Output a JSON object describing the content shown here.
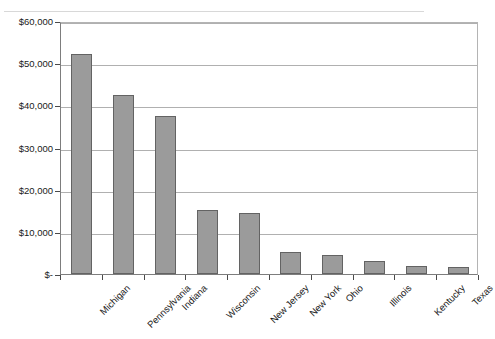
{
  "chart_data": {
    "type": "bar",
    "title": "",
    "subtitle": "",
    "xlabel": "",
    "ylabel": "",
    "categories": [
      "Michigan",
      "Pennsylvania",
      "Indiana",
      "Wisconsin",
      "New Jersey",
      "New York",
      "Ohio",
      "Illinois",
      "Kentucky",
      "Texas"
    ],
    "values": [
      52200,
      42500,
      37500,
      15100,
      14400,
      5200,
      4600,
      3100,
      1800,
      1600
    ],
    "ylim": [
      0,
      60000
    ],
    "ytick_values": [
      0,
      10000,
      20000,
      30000,
      40000,
      50000,
      60000
    ],
    "ytick_labels": [
      "$-",
      "$10,000",
      "$20,000",
      "$30,000",
      "$40,000",
      "$50,000",
      "$60,000"
    ],
    "grid": true,
    "grid_axis": "y",
    "legend": false,
    "legend_position": "none",
    "series": [
      {
        "name": "",
        "values": [
          52200,
          42500,
          37500,
          15100,
          14400,
          5200,
          4600,
          3100,
          1800,
          1600
        ]
      }
    ],
    "annotations": []
  },
  "style": {
    "bar_fill": "#9b9b9b",
    "bar_border": "#636363",
    "gridline_color": "#b0b0b0",
    "axis_color": "#7d7d7d",
    "text_color": "#1a1a1a",
    "background": "#ffffff"
  },
  "artifacts": {
    "bleed_line_1": "",
    "bleed_line_2": ""
  }
}
